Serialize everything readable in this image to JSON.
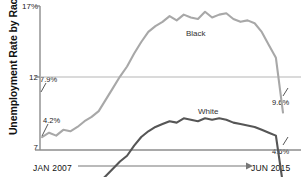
{
  "chart_data": {
    "type": "line",
    "title": "",
    "ylabel": "Unemployment Rate by Race",
    "xlabel": "",
    "ylim": [
      7,
      17
    ],
    "yticks": [
      "17%",
      "12",
      "7"
    ],
    "ytick_values": [
      17,
      12,
      7
    ],
    "grid": "horizontal gridline at 12",
    "legend_position": "inline labels on series",
    "x_start_label": "JAN 2007",
    "x_end_label": "JUN 2015",
    "x": [
      "Jan 2007",
      "Apr 2007",
      "Jul 2007",
      "Oct 2007",
      "Jan 2008",
      "Apr 2008",
      "Jul 2008",
      "Oct 2008",
      "Jan 2009",
      "Apr 2009",
      "Jul 2009",
      "Oct 2009",
      "Jan 2010",
      "Apr 2010",
      "Jul 2010",
      "Oct 2010",
      "Jan 2011",
      "Apr 2011",
      "Jul 2011",
      "Oct 2011",
      "Jan 2012",
      "Apr 2012",
      "Jul 2012",
      "Oct 2012",
      "Jan 2013",
      "Apr 2013",
      "Jul 2013",
      "Oct 2013",
      "Jan 2014",
      "Apr 2014",
      "Jul 2014",
      "Oct 2014",
      "Jan 2015",
      "Apr 2015",
      "Jun 2015"
    ],
    "series": [
      {
        "name": "Black",
        "color": "#a8a8a8",
        "start_value": 7.9,
        "end_value": 9.6,
        "start_label": "7.9%",
        "end_label": "9.6%",
        "values": [
          7.9,
          8.2,
          8.0,
          8.4,
          8.3,
          8.6,
          9.0,
          9.3,
          9.7,
          10.5,
          11.3,
          12.1,
          12.8,
          13.7,
          14.5,
          15.2,
          15.6,
          15.9,
          16.3,
          16.0,
          16.4,
          16.2,
          16.1,
          16.6,
          16.2,
          16.4,
          16.5,
          16.1,
          15.9,
          16.0,
          15.8,
          15.2,
          14.3,
          13.4,
          9.6
        ]
      },
      {
        "name": "White",
        "color": "#565656",
        "start_value": 4.2,
        "end_value": 4.6,
        "start_label": "4.2%",
        "end_label": "4.6%",
        "values": [
          4.2,
          4.1,
          4.2,
          4.2,
          4.3,
          4.3,
          4.4,
          4.6,
          4.7,
          5.2,
          5.7,
          6.2,
          6.6,
          7.3,
          7.9,
          8.3,
          8.6,
          8.8,
          9.0,
          8.9,
          9.2,
          9.1,
          9.0,
          9.2,
          9.1,
          9.2,
          9.1,
          8.9,
          8.8,
          8.7,
          8.6,
          8.4,
          8.2,
          8.0,
          4.6
        ]
      }
    ],
    "annotations": [
      {
        "text": "7.9%",
        "series": "Black",
        "position": "start"
      },
      {
        "text": "4.2%",
        "series": "White",
        "position": "start"
      },
      {
        "text": "9.6%",
        "series": "Black",
        "position": "end"
      },
      {
        "text": "4.6%",
        "series": "White",
        "position": "end"
      },
      {
        "text": "Black",
        "position": "inline-upper"
      },
      {
        "text": "White",
        "position": "inline-lower"
      }
    ]
  },
  "axis": {
    "y_title": "Unemployment Rate by Race",
    "y_tick_top": "17%",
    "y_tick_mid": "12",
    "y_tick_bottom": "7",
    "x_left": "JAN 2007",
    "x_right": "JUN 2015"
  },
  "labels": {
    "black_series": "Black",
    "white_series": "White",
    "black_start": "7.9%",
    "white_start": "4.2%",
    "black_end": "9.6%",
    "white_end": "4.6%"
  },
  "colors": {
    "black_line": "#a8a8a8",
    "white_line": "#565656",
    "axis": "#8c8c8c",
    "grid": "#b5b5b5",
    "background": "#ffffff"
  }
}
